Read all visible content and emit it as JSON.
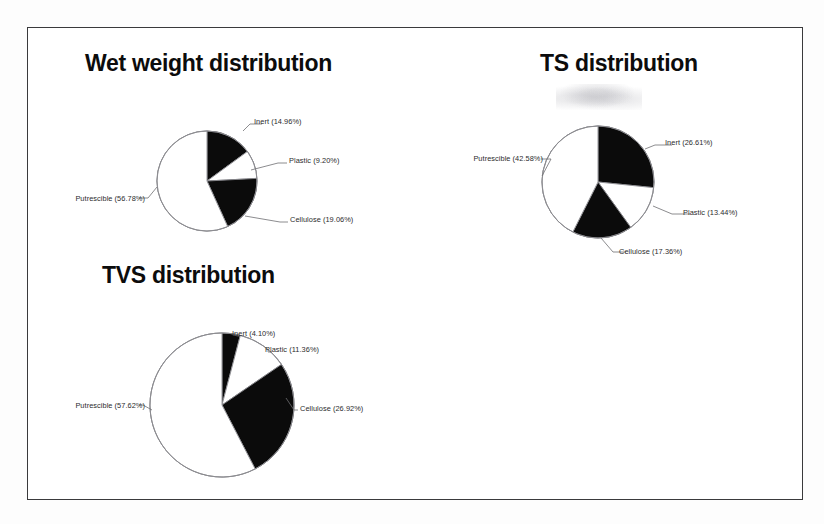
{
  "page": {
    "background_color": "#ffffff",
    "frame_color": "#3a3a3c",
    "slice_black": "#0b0b0b",
    "slice_white": "#ffffff",
    "outline_color": "#8a8a8e",
    "label_color": "#2b2b2d"
  },
  "charts": [
    {
      "id": "wet-weight",
      "title": "Wet weight distribution",
      "chart_data": {
        "type": "pie",
        "title": "Wet weight distribution",
        "categories": [
          "Inert",
          "Plastic",
          "Cellulose",
          "Putrescible"
        ],
        "values": [
          14.96,
          9.2,
          19.06,
          56.78
        ],
        "unit": "%",
        "start_angle_deg": 0,
        "direction": "clockwise",
        "colors": [
          "#0b0b0b",
          "#ffffff",
          "#0b0b0b",
          "#ffffff"
        ],
        "legend": "none",
        "labels": [
          "Inert (14.96%)",
          "Plastic (9.20%)",
          "Cellulose (19.06%)",
          "Putrescible (56.78%)"
        ]
      }
    },
    {
      "id": "ts",
      "title": "TS distribution",
      "chart_data": {
        "type": "pie",
        "title": "TS distribution",
        "categories": [
          "Inert",
          "Plastic",
          "Cellulose",
          "Putrescible"
        ],
        "values": [
          26.61,
          13.44,
          17.36,
          42.58
        ],
        "unit": "%",
        "start_angle_deg": 0,
        "direction": "clockwise",
        "colors": [
          "#0b0b0b",
          "#ffffff",
          "#0b0b0b",
          "#ffffff"
        ],
        "legend": "none",
        "labels": [
          "Inert (26.61%)",
          "Plastic (13.44%)",
          "Cellulose (17.36%)",
          "Putrescible (42.58%)"
        ]
      }
    },
    {
      "id": "tvs",
      "title": "TVS distribution",
      "chart_data": {
        "type": "pie",
        "title": "TVS distribution",
        "categories": [
          "Inert",
          "Plastic",
          "Cellulose",
          "Putrescible"
        ],
        "values": [
          4.1,
          11.36,
          26.92,
          57.62
        ],
        "unit": "%",
        "start_angle_deg": 0,
        "direction": "clockwise",
        "colors": [
          "#0b0b0b",
          "#ffffff",
          "#0b0b0b",
          "#ffffff"
        ],
        "legend": "none",
        "labels": [
          "Inert (4.10%)",
          "Plastic (11.36%)",
          "Cellulose (26.92%)",
          "Putrescible (57.62%)"
        ]
      }
    }
  ]
}
